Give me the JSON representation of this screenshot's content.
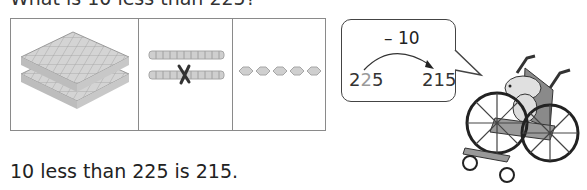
{
  "question": "What is 10 less than 225?",
  "panels": [
    {
      "label": "hundreds",
      "count": 2,
      "icon": "hundreds-flat-icon"
    },
    {
      "label": "tens",
      "count": 2,
      "crossed_out": 1,
      "icon": "tens-rod-icon"
    },
    {
      "label": "ones",
      "count": 5,
      "icon": "ones-cube-icon"
    }
  ],
  "bubble": {
    "operation": "– 10",
    "start_digits": [
      "2",
      "2",
      "5"
    ],
    "end": "215"
  },
  "answer": "10 less than 225 is 215.",
  "colors": {
    "block": "#cfcfcf",
    "block_line": "#9a9a9a",
    "highlight_digit": "#9a9a9a",
    "border": "#8a8a8a"
  }
}
